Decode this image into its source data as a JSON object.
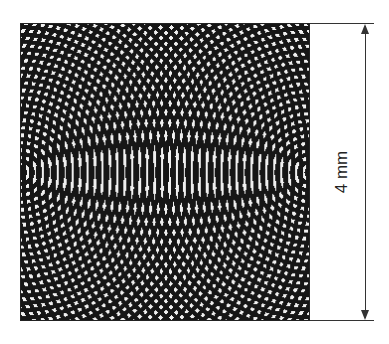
{
  "figure": {
    "pattern": {
      "type": "two-point-source interference",
      "foreground_color": "#111111",
      "background_color": "#f4f4f4",
      "source_left": [
        0.0,
        0.5
      ],
      "source_right": [
        1.0,
        0.5
      ],
      "ring_spacing_px": 7.5
    },
    "dimension": {
      "label": "4 mm",
      "orientation": "vertical",
      "line_color": "#333333"
    }
  }
}
